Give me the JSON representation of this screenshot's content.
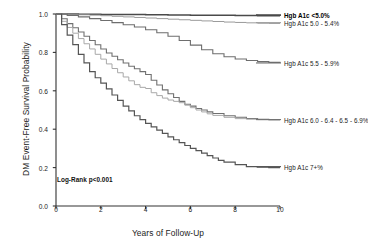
{
  "chart_data": {
    "type": "line",
    "title": "",
    "subtitle": "",
    "xlabel": "Years of Follow-Up",
    "ylabel": "DM Event-Free Survival Probability",
    "xlim": [
      0,
      10
    ],
    "ylim": [
      0.0,
      1.0
    ],
    "xticks": [
      "0",
      "2",
      "4",
      "6",
      "8",
      "10"
    ],
    "xtick_values": [
      0,
      2,
      4,
      6,
      8,
      10
    ],
    "yticks": [
      "0.0",
      "0.2",
      "0.4",
      "0.6",
      "0.8",
      "1.0"
    ],
    "ytick_values": [
      0.0,
      0.2,
      0.4,
      0.6,
      0.8,
      1.0
    ],
    "grid": false,
    "legend_position": "inline-right",
    "annotation": "Log-Rank p<0.001",
    "series": [
      {
        "name": "Hgb A1c <5.0%",
        "color": "#4a4a4a",
        "width": 1.5,
        "label_bold": true,
        "label_y": 0.995,
        "x": [
          0,
          0.5,
          1,
          1.5,
          2,
          2.5,
          3,
          3.5,
          4,
          4.5,
          5,
          5.5,
          6,
          6.5,
          7,
          7.5,
          8,
          8.5,
          9,
          9.5,
          10
        ],
        "values": [
          1.0,
          1.0,
          0.999,
          0.999,
          0.998,
          0.998,
          0.997,
          0.997,
          0.996,
          0.996,
          0.995,
          0.995,
          0.994,
          0.994,
          0.993,
          0.993,
          0.992,
          0.992,
          0.991,
          0.991,
          0.99
        ]
      },
      {
        "name": "Hgb A1c 5.0 - 5.4%",
        "color": "#9a9a9a",
        "width": 1.0,
        "label_bold": false,
        "label_y": 0.955,
        "x": [
          0,
          0.5,
          1,
          1.5,
          2,
          2.5,
          3,
          3.5,
          4,
          4.5,
          5,
          5.5,
          6,
          6.5,
          7,
          7.5,
          8,
          8.5,
          9,
          9.5,
          10
        ],
        "values": [
          1.0,
          0.998,
          0.996,
          0.994,
          0.991,
          0.988,
          0.985,
          0.982,
          0.979,
          0.976,
          0.973,
          0.97,
          0.967,
          0.964,
          0.961,
          0.958,
          0.956,
          0.954,
          0.952,
          0.951,
          0.95
        ]
      },
      {
        "name": "Hgb A1c 5.5 - 5.9%",
        "color": "#6e6e6e",
        "width": 1.1,
        "label_bold": false,
        "label_y": 0.745,
        "x": [
          0,
          0.5,
          1,
          1.5,
          2,
          2.5,
          3,
          3.5,
          4,
          4.5,
          5,
          5.5,
          6,
          6.5,
          7,
          7.5,
          8,
          8.5,
          9,
          9.5,
          10
        ],
        "values": [
          1.0,
          0.993,
          0.985,
          0.976,
          0.966,
          0.955,
          0.944,
          0.932,
          0.918,
          0.902,
          0.884,
          0.862,
          0.838,
          0.814,
          0.793,
          0.777,
          0.766,
          0.758,
          0.752,
          0.748,
          0.745
        ]
      },
      {
        "name": "Hgb A1c 6.0 - 6.4 - 6.5 - 6.9%",
        "color": "#707070",
        "width": 1.1,
        "label_bold": false,
        "label_y": 0.45,
        "x": [
          0,
          0.25,
          0.5,
          0.75,
          1,
          1.25,
          1.5,
          1.75,
          2,
          2.25,
          2.5,
          2.75,
          3,
          3.25,
          3.5,
          3.75,
          4,
          4.25,
          4.5,
          4.75,
          5,
          5.25,
          5.5,
          5.75,
          6,
          6.25,
          6.5,
          6.75,
          7,
          7.5,
          8,
          8.5,
          9,
          9.5,
          10
        ],
        "values": [
          1.0,
          0.975,
          0.95,
          0.928,
          0.906,
          0.884,
          0.862,
          0.84,
          0.818,
          0.797,
          0.78,
          0.762,
          0.745,
          0.728,
          0.715,
          0.7,
          0.685,
          0.655,
          0.63,
          0.605,
          0.585,
          0.565,
          0.545,
          0.53,
          0.52,
          0.508,
          0.5,
          0.49,
          0.482,
          0.47,
          0.462,
          0.456,
          0.452,
          0.45,
          0.448
        ]
      },
      {
        "name": "Hgb A1c 6.0 - 6.4 - 6.5 - 6.9% (b)",
        "color": "#a8a8a8",
        "width": 1.0,
        "label_bold": false,
        "label_y": null,
        "x": [
          0,
          0.25,
          0.5,
          0.75,
          1,
          1.25,
          1.5,
          1.75,
          2,
          2.25,
          2.5,
          2.75,
          3,
          3.25,
          3.5,
          3.75,
          4,
          4.25,
          4.5,
          4.75,
          5,
          5.25,
          5.5,
          5.75,
          6,
          6.25,
          6.5,
          6.75,
          7,
          7.5,
          8,
          8.5,
          9,
          9.5,
          10
        ],
        "values": [
          1.0,
          0.962,
          0.93,
          0.9,
          0.872,
          0.845,
          0.818,
          0.79,
          0.765,
          0.74,
          0.716,
          0.694,
          0.672,
          0.652,
          0.632,
          0.618,
          0.612,
          0.59,
          0.575,
          0.562,
          0.552,
          0.545,
          0.538,
          0.525,
          0.512,
          0.5,
          0.49,
          0.48,
          0.472,
          0.462,
          0.455,
          0.452,
          0.45,
          0.449,
          0.448
        ]
      },
      {
        "name": "Hgb A1c 7+%",
        "color": "#555555",
        "width": 1.2,
        "label_bold": false,
        "label_y": 0.205,
        "x": [
          0,
          0.25,
          0.5,
          0.75,
          1,
          1.25,
          1.5,
          1.75,
          2,
          2.25,
          2.5,
          2.75,
          3,
          3.25,
          3.5,
          3.75,
          4,
          4.25,
          4.5,
          4.75,
          5,
          5.25,
          5.5,
          5.75,
          6,
          6.25,
          6.5,
          6.75,
          7,
          7.25,
          7.5,
          8,
          8.5,
          9,
          9.5,
          10
        ],
        "values": [
          1.0,
          0.945,
          0.89,
          0.84,
          0.79,
          0.745,
          0.7,
          0.668,
          0.64,
          0.61,
          0.578,
          0.55,
          0.52,
          0.495,
          0.47,
          0.45,
          0.43,
          0.412,
          0.395,
          0.378,
          0.36,
          0.345,
          0.33,
          0.315,
          0.3,
          0.288,
          0.275,
          0.262,
          0.25,
          0.238,
          0.228,
          0.215,
          0.205,
          0.202,
          0.2,
          0.2
        ]
      }
    ]
  },
  "axis": {
    "y_title": "DM Event-Free Survival Probability",
    "x_title": "Years of Follow-Up"
  },
  "annotation": {
    "logrank": "Log-Rank p<0.001"
  },
  "labels": {
    "a1c_under5": "Hgb A1c <5.0%",
    "a1c_50_54": "Hgb A1c 5.0 - 5.4%",
    "a1c_55_59": "Hgb A1c 5.5 - 5.9%",
    "a1c_60_69": "Hgb A1c 6.0 - 6.4 - 6.5 - 6.9%",
    "a1c_7plus": "Hgb A1c 7+%"
  },
  "colors": {
    "axis": "#333333",
    "text": "#1c1c1c",
    "background": "#ffffff"
  }
}
